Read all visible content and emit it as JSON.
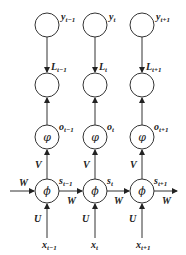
{
  "diagram": {
    "type": "unrolled-rnn",
    "columns": [
      {
        "y": "y",
        "y_sub": "t−1",
        "L": "L",
        "L_sub": "t−1",
        "o": "o",
        "o_sub": "t−1",
        "s": "s",
        "s_sub": "t−1",
        "x": "x",
        "x_sub": "t−1",
        "phi": "φ",
        "Phi": "ϕ"
      },
      {
        "y": "y",
        "y_sub": "t",
        "L": "L",
        "L_sub": "t",
        "o": "o",
        "o_sub": "t",
        "s": "s",
        "s_sub": "t",
        "x": "x",
        "x_sub": "t",
        "phi": "φ",
        "Phi": "ϕ"
      },
      {
        "y": "y",
        "y_sub": "t+1",
        "L": "L",
        "L_sub": "t+1",
        "o": "o",
        "o_sub": "t+1",
        "s": "s",
        "s_sub": "t+1",
        "x": "x",
        "x_sub": "t+1",
        "phi": "φ",
        "Phi": "ϕ"
      }
    ],
    "weights": {
      "input": "U",
      "hidden": "W",
      "output": "V"
    }
  }
}
